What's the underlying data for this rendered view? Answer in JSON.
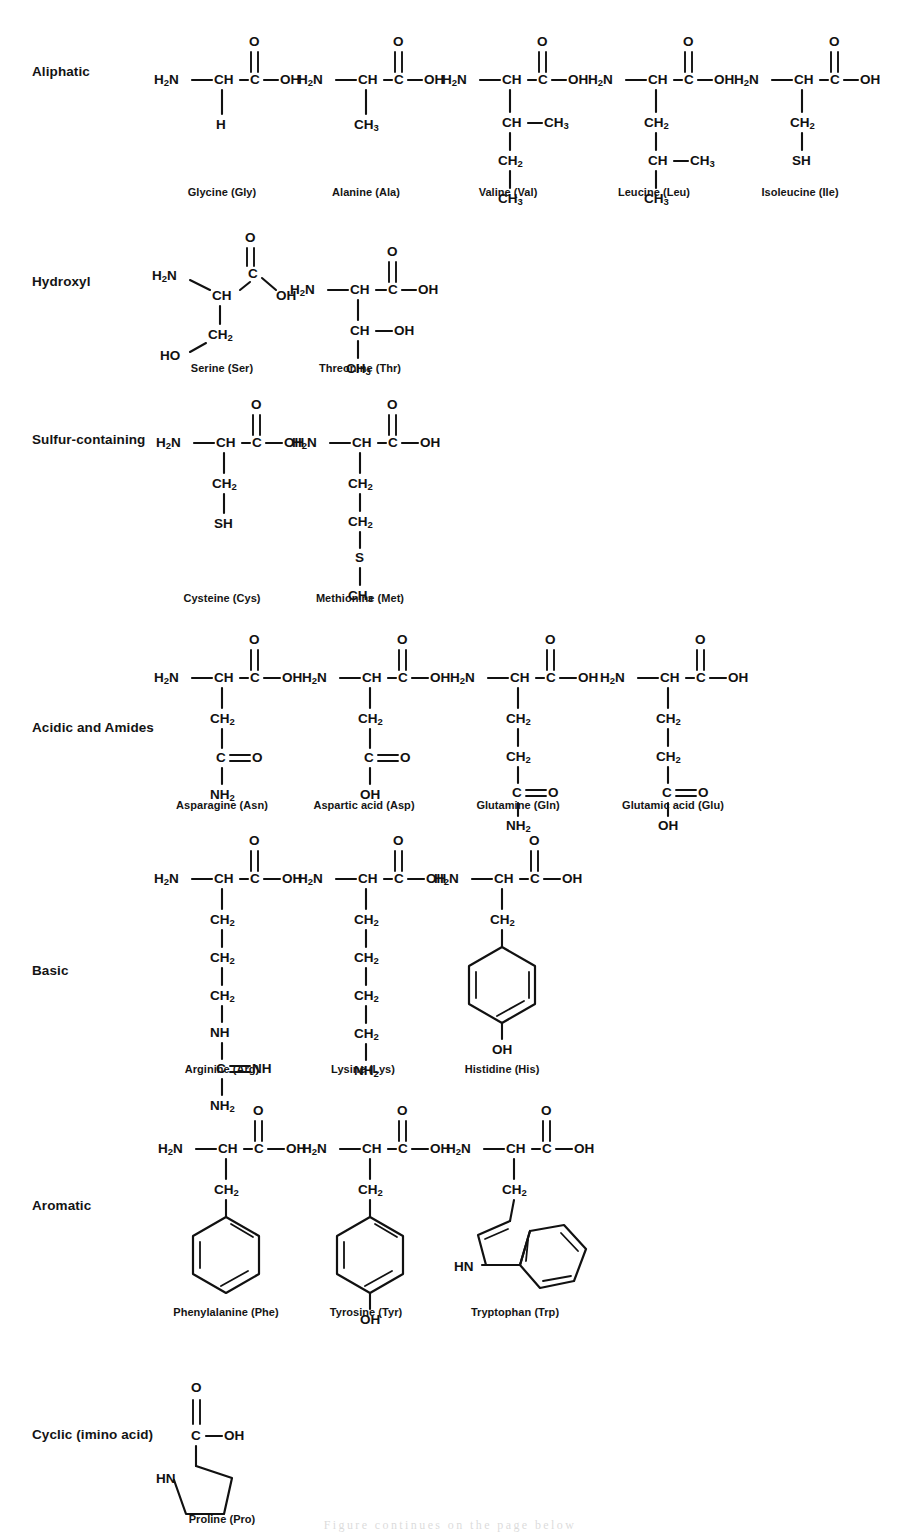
{
  "document": {
    "title": "Amino acid structures by side-chain class",
    "background_color": "#ffffff",
    "ink_color": "#111111"
  },
  "categories": [
    {
      "id": "aliphatic",
      "label": "Aliphatic"
    },
    {
      "id": "hydroxyl",
      "label": "Hydroxyl"
    },
    {
      "id": "sulfur",
      "label": "Sulfur-containing"
    },
    {
      "id": "acidic",
      "label": "Acidic and Amides"
    },
    {
      "id": "basic",
      "label": "Basic"
    },
    {
      "id": "aromatic",
      "label": "Aromatic"
    },
    {
      "id": "cyclic",
      "label": "Cyclic (imino acid)"
    }
  ],
  "molecules": {
    "glycine": {
      "name": "Glycine (Gly)",
      "backbone": [
        "H2N",
        "CH",
        "C",
        "OH",
        "O"
      ],
      "side_chain": [
        "H"
      ]
    },
    "alanine": {
      "name": "Alanine (Ala)",
      "backbone": [
        "H2N",
        "CH",
        "C",
        "OH",
        "O"
      ],
      "side_chain": [
        "CH3"
      ]
    },
    "valine": {
      "name": "Valine (Val)",
      "backbone": [
        "H2N",
        "CH",
        "C",
        "OH",
        "O"
      ],
      "side_chain": [
        "CH",
        "CH3",
        "CH2",
        "CH3"
      ]
    },
    "leucine": {
      "name": "Leucine (Leu)",
      "backbone": [
        "H2N",
        "CH",
        "C",
        "OH",
        "O"
      ],
      "side_chain": [
        "CH2",
        "CH",
        "CH3",
        "CH3"
      ]
    },
    "isoleucine": {
      "name": "Isoleucine (Ile)",
      "backbone": [
        "H2N",
        "CH",
        "C",
        "OH",
        "O"
      ],
      "side_chain": [
        "CH2",
        "SH"
      ]
    },
    "serine": {
      "name": "Serine (Ser)",
      "backbone": [
        "H2N",
        "CH",
        "C",
        "OH",
        "O"
      ],
      "side_chain": [
        "CH2",
        "HO"
      ]
    },
    "threonine": {
      "name": "Threonine (Thr)",
      "backbone": [
        "H2N",
        "CH",
        "C",
        "OH",
        "O"
      ],
      "side_chain": [
        "CH",
        "OH",
        "CH3"
      ]
    },
    "cysteine": {
      "name": "Cysteine (Cys)",
      "backbone": [
        "H2N",
        "CH",
        "C",
        "OH",
        "O"
      ],
      "side_chain": [
        "CH2",
        "SH"
      ]
    },
    "methionine": {
      "name": "Methionine (Met)",
      "backbone": [
        "H2N",
        "CH",
        "C",
        "OH",
        "O"
      ],
      "side_chain": [
        "CH2",
        "CH2",
        "S",
        "CH3"
      ]
    },
    "asparagine": {
      "name": "Asparagine (Asn)",
      "backbone": [
        "H2N",
        "CH",
        "C",
        "OH",
        "O"
      ],
      "side_chain": [
        "CH2",
        "C",
        "O",
        "NH2"
      ]
    },
    "aspartic_acid": {
      "name": "Aspartic acid (Asp)",
      "backbone": [
        "H2N",
        "CH",
        "C",
        "OH",
        "O"
      ],
      "side_chain": [
        "CH2",
        "C",
        "O",
        "OH"
      ]
    },
    "glutamine": {
      "name": "Glutamine (Gln)",
      "backbone": [
        "H2N",
        "CH",
        "C",
        "OH",
        "O"
      ],
      "side_chain": [
        "CH2",
        "CH2",
        "C",
        "O",
        "NH2"
      ]
    },
    "glutamic_acid": {
      "name": "Glutamic acid (Glu)",
      "backbone": [
        "H2N",
        "CH",
        "C",
        "OH",
        "O"
      ],
      "side_chain": [
        "CH2",
        "CH2",
        "C",
        "O",
        "OH"
      ]
    },
    "arginine": {
      "name": "Arginine (Arg)",
      "backbone": [
        "H2N",
        "CH",
        "C",
        "OH",
        "O"
      ],
      "side_chain": [
        "CH2",
        "CH2",
        "CH2",
        "NH",
        "C",
        "NH",
        "NH2"
      ]
    },
    "lysine": {
      "name": "Lysine (Lys)",
      "backbone": [
        "H2N",
        "CH",
        "C",
        "OH",
        "O"
      ],
      "side_chain": [
        "CH2",
        "CH2",
        "CH2",
        "CH2",
        "NH2"
      ]
    },
    "histidine": {
      "name": "Histidine (His)",
      "backbone": [
        "H2N",
        "CH",
        "C",
        "OH",
        "O"
      ],
      "side_chain": [
        "CH2",
        "ring-benzene",
        "OH"
      ]
    },
    "phenylalanine": {
      "name": "Phenylalanine (Phe)",
      "backbone": [
        "H2N",
        "CH",
        "C",
        "OH",
        "O"
      ],
      "side_chain": [
        "CH2",
        "ring-benzene"
      ]
    },
    "tyrosine": {
      "name": "Tyrosine (Tyr)",
      "backbone": [
        "H2N",
        "CH",
        "C",
        "OH",
        "O"
      ],
      "side_chain": [
        "CH2",
        "ring-benzene",
        "OH"
      ]
    },
    "tryptophan": {
      "name": "Tryptophan (Trp)",
      "backbone": [
        "H2N",
        "CH",
        "C",
        "OH",
        "O"
      ],
      "side_chain": [
        "CH2",
        "ring-indole",
        "HN"
      ]
    },
    "proline": {
      "name": "Proline (Pro)",
      "backbone": [
        "C",
        "OH",
        "O"
      ],
      "side_chain": [
        "ring-pyrrolidine",
        "HN"
      ]
    }
  },
  "atoms": {
    "H2N": "H₂N",
    "NH2": "NH₂",
    "CH": "CH",
    "CH2": "CH₂",
    "CH3": "CH₃",
    "C": "C",
    "O": "O",
    "OH": "OH",
    "HO": "HO",
    "SH": "SH",
    "S": "S",
    "NH": "NH",
    "HN": "HN",
    "H": "H"
  },
  "page_footer_text": "Figure continues on the page below"
}
